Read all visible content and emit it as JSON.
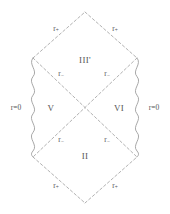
{
  "figure": {
    "kind": "penrose-conformal-diagram",
    "background_color": "#ffffff",
    "line_color": "#9a9a9a",
    "text_color": "#555555"
  },
  "regions": [
    {
      "id": "III-prime",
      "label": "III'",
      "x": 85,
      "y": 60
    },
    {
      "id": "V",
      "label": "V",
      "x": 51,
      "y": 108
    },
    {
      "id": "VI",
      "label": "VI",
      "x": 119,
      "y": 108
    },
    {
      "id": "II",
      "label": "II",
      "x": 85,
      "y": 156
    }
  ],
  "horizon_labels": [
    {
      "id": "outer-top-left",
      "base": "r",
      "sub": "+",
      "x": 56,
      "y": 29
    },
    {
      "id": "outer-top-right",
      "base": "r",
      "sub": "+",
      "x": 115,
      "y": 29
    },
    {
      "id": "inner-upper-left",
      "base": "r",
      "sub": "−",
      "x": 61,
      "y": 74
    },
    {
      "id": "inner-upper-right",
      "base": "r",
      "sub": "−",
      "x": 107,
      "y": 74
    },
    {
      "id": "inner-lower-left",
      "base": "r",
      "sub": "−",
      "x": 61,
      "y": 140
    },
    {
      "id": "inner-lower-right",
      "base": "r",
      "sub": "−",
      "x": 107,
      "y": 140
    },
    {
      "id": "outer-bottom-left",
      "base": "r",
      "sub": "+",
      "x": 56,
      "y": 186
    },
    {
      "id": "outer-bottom-right",
      "base": "r",
      "sub": "+",
      "x": 115,
      "y": 186
    }
  ],
  "singularity_labels": [
    {
      "id": "singularity-left",
      "label": "r=0",
      "x": 16,
      "y": 108
    },
    {
      "id": "singularity-right",
      "label": "r=0",
      "x": 154,
      "y": 108
    }
  ],
  "geometry": {
    "apex_top": {
      "x": 85,
      "y": 12
    },
    "apex_bottom": {
      "x": 85,
      "y": 203
    },
    "left_upper": {
      "x": 33,
      "y": 58
    },
    "left_lower": {
      "x": 33,
      "y": 157
    },
    "right_upper": {
      "x": 137,
      "y": 58
    },
    "right_lower": {
      "x": 137,
      "y": 157
    },
    "center": {
      "x": 85,
      "y": 108
    }
  }
}
